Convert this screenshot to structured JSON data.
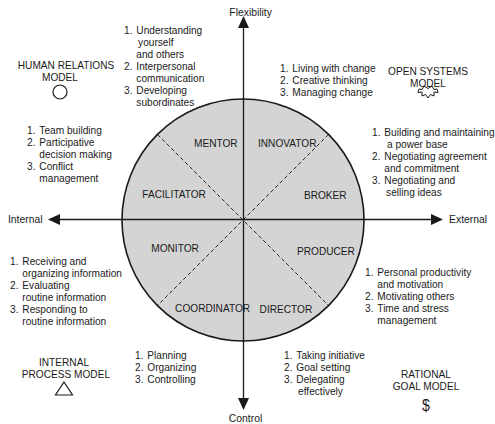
{
  "axes": {
    "top": "Flexibility",
    "bottom": "Control",
    "left": "Internal",
    "right": "External"
  },
  "models": {
    "human_relations": {
      "line1": "HUMAN RELATIONS",
      "line2": "MODEL",
      "icon": "circle-icon"
    },
    "open_systems": {
      "line1": "OPEN SYSTEMS",
      "line2": "MODEL",
      "icon": "starburst-icon"
    },
    "internal_process": {
      "line1": "INTERNAL",
      "line2": "PROCESS MODEL",
      "icon": "triangle-icon"
    },
    "rational_goal": {
      "line1": "RATIONAL",
      "line2": "GOAL MODEL",
      "icon": "$"
    }
  },
  "roles": {
    "mentor": "MENTOR",
    "innovator": "INNOVATOR",
    "facilitator": "FACILITATOR",
    "broker": "BROKER",
    "monitor": "MONITOR",
    "producer": "PRODUCER",
    "coordinator": "COORDINATOR",
    "director": "DIRECTOR"
  },
  "competencies": {
    "mentor": [
      {
        "num": "1.",
        "lines": [
          "Understanding",
          "yourself",
          "and others"
        ]
      },
      {
        "num": "2.",
        "lines": [
          "Interpersonal",
          "communication"
        ]
      },
      {
        "num": "3.",
        "lines": [
          "Developing",
          "subordinates"
        ]
      }
    ],
    "innovator": [
      {
        "num": "1.",
        "lines": [
          "Living with change"
        ]
      },
      {
        "num": "2.",
        "lines": [
          "Creative thinking"
        ]
      },
      {
        "num": "3.",
        "lines": [
          "Managing change"
        ]
      }
    ],
    "facilitator": [
      {
        "num": "1.",
        "lines": [
          "Team building"
        ]
      },
      {
        "num": "2.",
        "lines": [
          "Participative",
          "decision making"
        ]
      },
      {
        "num": "3.",
        "lines": [
          "Conflict",
          "management"
        ]
      }
    ],
    "broker": [
      {
        "num": "1.",
        "lines": [
          "Building and maintaining",
          "a power base"
        ]
      },
      {
        "num": "2.",
        "lines": [
          "Negotiating agreement",
          "and commitment"
        ]
      },
      {
        "num": "3.",
        "lines": [
          "Negotiating and",
          "selling ideas"
        ]
      }
    ],
    "monitor": [
      {
        "num": "1.",
        "lines": [
          "Receiving and",
          "organizing information"
        ]
      },
      {
        "num": "2.",
        "lines": [
          "Evaluating",
          "routine information"
        ]
      },
      {
        "num": "3.",
        "lines": [
          "Responding to",
          "routine information"
        ]
      }
    ],
    "producer": [
      {
        "num": "1.",
        "lines": [
          "Personal productivity",
          "and motivation"
        ]
      },
      {
        "num": "2.",
        "lines": [
          "Motivating others"
        ]
      },
      {
        "num": "3.",
        "lines": [
          "Time and stress",
          "management"
        ]
      }
    ],
    "coordinator": [
      {
        "num": "1.",
        "lines": [
          "Planning"
        ]
      },
      {
        "num": "2.",
        "lines": [
          "Organizing"
        ]
      },
      {
        "num": "3.",
        "lines": [
          "Controlling"
        ]
      }
    ],
    "director": [
      {
        "num": "1.",
        "lines": [
          "Taking initiative"
        ]
      },
      {
        "num": "2.",
        "lines": [
          "Goal setting"
        ]
      },
      {
        "num": "3.",
        "lines": [
          "Delegating",
          "effectively"
        ]
      }
    ]
  },
  "colors": {
    "circle_fill": "#d4d4d4",
    "line": "#1a1a1a",
    "background": "#ffffff"
  }
}
